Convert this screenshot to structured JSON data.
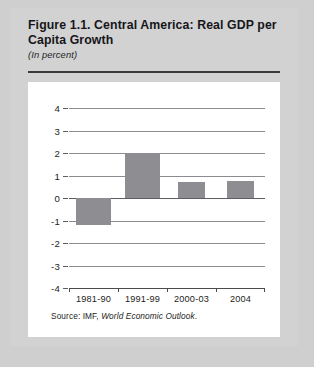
{
  "figure": {
    "title": "Figure 1.1.  Central America: Real GDP per Capita Growth",
    "subtitle": "(In percent)",
    "source_prefix": "Source: IMF,",
    "source_italic": "World Economic Outlook",
    "source_suffix": "."
  },
  "chart_data": {
    "type": "bar",
    "title": "Figure 1.1.  Central America: Real GDP per Capita Growth",
    "subtitle": "(In percent)",
    "xlabel": "",
    "ylabel": "",
    "ylim": [
      -4,
      4
    ],
    "yticks": [
      4,
      3,
      2,
      1,
      0,
      -1,
      -2,
      -3,
      -4
    ],
    "ytick_labels": [
      "4",
      "3",
      "2",
      "1",
      "0",
      "-1",
      "-2",
      "-3",
      "-4"
    ],
    "grid": true,
    "legend": false,
    "categories": [
      "1981-90",
      "1991-99",
      "2000-03",
      "2004"
    ],
    "values": [
      -1.2,
      2.0,
      0.7,
      0.75
    ],
    "bar_color": "#8e8e92"
  },
  "colors": {
    "page_background": "#cfcfcf",
    "card_background": "#d2d2d2",
    "panel_background": "#ffffff",
    "bar": "#8e8e92",
    "gridline": "#8b8b90",
    "axis": "#4a4a4f",
    "text": "#1d1d21"
  }
}
